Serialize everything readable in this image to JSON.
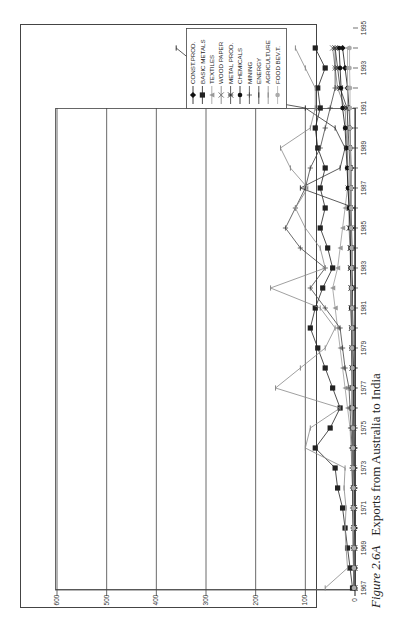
{
  "figure": {
    "label": "Figure 2.6A",
    "title": "Exports from Australia to India"
  },
  "chart_data": {
    "type": "line",
    "title": "Exports from Australia to India",
    "orientation": "rotated-90-ccw",
    "xlabel": "",
    "ylabel": "",
    "x": [
      1967,
      1968,
      1969,
      1970,
      1971,
      1972,
      1973,
      1974,
      1975,
      1976,
      1977,
      1978,
      1979,
      1980,
      1981,
      1982,
      1983,
      1984,
      1985,
      1986,
      1987,
      1988,
      1989,
      1990,
      1991,
      1992,
      1993,
      1994,
      1995,
      1996
    ],
    "x_tick_labels": [
      "1967",
      "1969",
      "1971",
      "1973",
      "1975",
      "1977",
      "1979",
      "1981",
      "1983",
      "1985",
      "1987",
      "1989",
      "1991",
      "1993",
      "1995"
    ],
    "ylim": [
      0,
      600
    ],
    "y_ticks": [
      0,
      100,
      200,
      300,
      400,
      500,
      600
    ],
    "grid": true,
    "legend_position": "top-right (rotated)",
    "series": [
      {
        "name": "CONST.PROD.",
        "marker": "diamond",
        "color": "#111111",
        "values": [
          1,
          1,
          1,
          1,
          2,
          2,
          2,
          2,
          3,
          3,
          3,
          3,
          4,
          4,
          5,
          5,
          6,
          6,
          7,
          8,
          8,
          8,
          9,
          10,
          12,
          15,
          20,
          25,
          30,
          35
        ]
      },
      {
        "name": "BASIC METALS",
        "marker": "square",
        "color": "#222222",
        "values": [
          5,
          10,
          15,
          20,
          25,
          35,
          40,
          80,
          50,
          30,
          45,
          60,
          75,
          90,
          80,
          65,
          45,
          55,
          70,
          60,
          70,
          60,
          75,
          80,
          70,
          75,
          60,
          80,
          95,
          100
        ]
      },
      {
        "name": "TEXTILES",
        "marker": "triangle",
        "color": "#999999",
        "values": [
          2,
          3,
          3,
          4,
          5,
          5,
          6,
          8,
          10,
          15,
          20,
          25,
          30,
          35,
          40,
          45,
          35,
          30,
          25,
          20,
          15,
          15,
          15,
          15,
          15,
          15,
          15,
          15,
          15,
          15
        ]
      },
      {
        "name": "WOOD PAPER",
        "marker": "x",
        "color": "#777777",
        "values": [
          1,
          1,
          2,
          2,
          3,
          3,
          4,
          4,
          5,
          5,
          5,
          6,
          6,
          7,
          8,
          8,
          9,
          10,
          12,
          12,
          14,
          14,
          16,
          18,
          20,
          35,
          40,
          45,
          55,
          60
        ]
      },
      {
        "name": "METAL PROD.",
        "marker": "asterisk",
        "color": "#333333",
        "values": [
          1,
          1,
          1,
          2,
          2,
          2,
          3,
          3,
          3,
          4,
          4,
          5,
          5,
          6,
          6,
          7,
          8,
          8,
          9,
          10,
          10,
          10,
          12,
          14,
          16,
          30,
          35,
          40,
          60,
          70
        ]
      },
      {
        "name": "CHEMICALS",
        "marker": "circle",
        "color": "#111111",
        "values": [
          2,
          2,
          3,
          3,
          3,
          4,
          4,
          5,
          5,
          6,
          6,
          6,
          7,
          7,
          8,
          8,
          9,
          9,
          10,
          12,
          14,
          16,
          18,
          20,
          25,
          28,
          30,
          32,
          35,
          40
        ]
      },
      {
        "name": "MINING",
        "marker": "plus",
        "color": "#444444",
        "values": [
          3,
          3,
          4,
          4,
          5,
          5,
          6,
          6,
          8,
          10,
          12,
          20,
          25,
          30,
          60,
          90,
          60,
          110,
          140,
          120,
          100,
          90,
          70,
          60,
          50,
          40,
          40,
          40,
          40,
          40
        ]
      },
      {
        "name": "ENERGY",
        "marker": "dash",
        "color": "#333333",
        "values": [
          0,
          0,
          0,
          0,
          0,
          0,
          0,
          0,
          0,
          0,
          0,
          0,
          0,
          0,
          0,
          0,
          0,
          0,
          0,
          0,
          110,
          30,
          20,
          40,
          100,
          330,
          310,
          360,
          440,
          495
        ]
      },
      {
        "name": "AGRICULTURE",
        "marker": "dash",
        "color": "#888888",
        "values": [
          60,
          15,
          18,
          20,
          18,
          22,
          20,
          100,
          90,
          30,
          160,
          110,
          60,
          40,
          70,
          170,
          60,
          70,
          100,
          120,
          95,
          130,
          150,
          90,
          80,
          80,
          100,
          120,
          130,
          150
        ]
      },
      {
        "name": "FOOD BEV.T.",
        "marker": "circle",
        "color": "#aaaaaa",
        "values": [
          2,
          2,
          2,
          3,
          3,
          3,
          4,
          4,
          4,
          5,
          5,
          5,
          6,
          6,
          6,
          7,
          7,
          7,
          8,
          8,
          8,
          9,
          9,
          10,
          10,
          10,
          11,
          11,
          12,
          12
        ]
      }
    ]
  },
  "legend": {
    "items": [
      {
        "label": "CONST.PROD.",
        "marker": "diamond"
      },
      {
        "label": "BASIC METALS",
        "marker": "square"
      },
      {
        "label": "TEXTILES",
        "marker": "triangle"
      },
      {
        "label": "WOOD PAPER",
        "marker": "x"
      },
      {
        "label": "METAL PROD.",
        "marker": "asterisk"
      },
      {
        "label": "CHEMICALS",
        "marker": "circle"
      },
      {
        "label": "MINING",
        "marker": "plus"
      },
      {
        "label": "ENERGY",
        "marker": "dash"
      },
      {
        "label": "AGRICULTURE",
        "marker": "dash"
      },
      {
        "label": "FOOD BEV.T.",
        "marker": "circle"
      }
    ]
  }
}
